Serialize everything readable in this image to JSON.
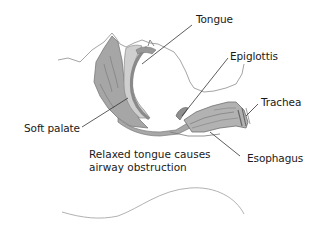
{
  "diagram": {
    "labels": {
      "tongue": "Tongue",
      "epiglottis": "Epiglottis",
      "trachea": "Trachea",
      "soft_palate": "Soft palate",
      "esophagus": "Esophagus"
    },
    "caption": {
      "line1": "Relaxed tongue causes",
      "line2": "airway obstruction"
    },
    "colors": {
      "tissue_fill": "#9a9a9a",
      "tissue_light": "#c4c4c4",
      "outline": "#8c8c8c",
      "leader_line": "#333333",
      "text": "#1a1a1a",
      "background": "#ffffff"
    }
  }
}
